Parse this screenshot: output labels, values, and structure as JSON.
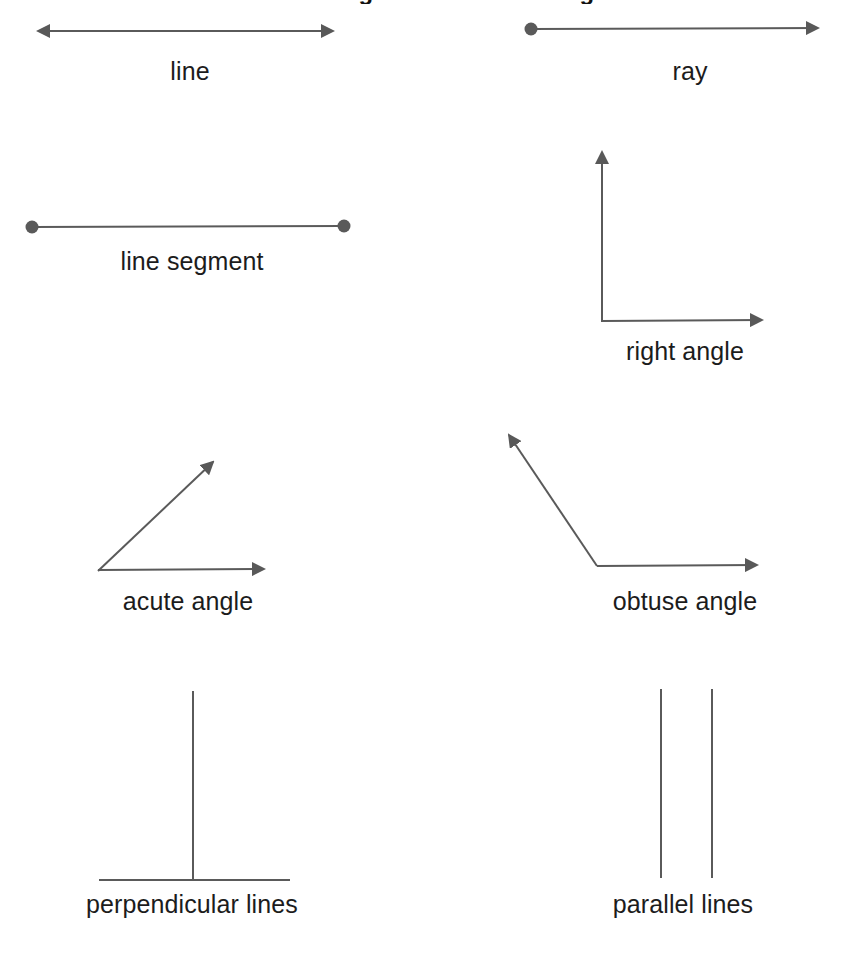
{
  "page": {
    "width": 847,
    "height": 958,
    "background": "#ffffff",
    "stroke_color": "#5a5a5a",
    "arrow_fill": "#595959",
    "label_color": "#1c1c1c",
    "cut_off_heading": "Lines and Angles Worksheet Diagram"
  },
  "figures": [
    {
      "id": "line",
      "label": "line",
      "type": "double-headed-arrow",
      "label_x": 190,
      "label_y": 57,
      "geometry": {
        "x1": 30,
        "y1": 31,
        "x2": 341,
        "y2": 31
      },
      "endpoints": {
        "start": "arrow",
        "end": "arrow"
      }
    },
    {
      "id": "ray",
      "label": "ray",
      "type": "single-headed-arrow-with-dot",
      "label_x": 690,
      "label_y": 57,
      "geometry": {
        "x1": 531,
        "y1": 29,
        "x2": 826,
        "y2": 28
      },
      "endpoints": {
        "start": "dot",
        "end": "arrow"
      }
    },
    {
      "id": "line-segment",
      "label": "line segment",
      "type": "segment-with-two-dots",
      "label_x": 192,
      "label_y": 247,
      "geometry": {
        "x1": 32,
        "y1": 227,
        "x2": 344,
        "y2": 226
      },
      "endpoints": {
        "start": "dot",
        "end": "dot"
      }
    },
    {
      "id": "right-angle",
      "label": "right angle",
      "type": "angle",
      "label_x": 685,
      "label_y": 337,
      "geometry": {
        "vertex_x": 602,
        "vertex_y": 322,
        "ray1_x": 602,
        "ray1_y": 142,
        "ray2_x": 772,
        "ray2_y": 320
      },
      "degrees": 90
    },
    {
      "id": "acute-angle",
      "label": "acute angle",
      "type": "angle",
      "label_x": 188,
      "label_y": 587,
      "geometry": {
        "vertex_x": 98,
        "vertex_y": 571,
        "ray1_x": 221,
        "ray1_y": 452,
        "ray2_x": 274,
        "ray2_y": 569
      },
      "degrees": 44
    },
    {
      "id": "obtuse-angle",
      "label": "obtuse angle",
      "type": "angle",
      "label_x": 685,
      "label_y": 587,
      "geometry": {
        "vertex_x": 597,
        "vertex_y": 566,
        "ray1_x": 500,
        "ray1_y": 424,
        "ray2_x": 767,
        "ray2_y": 565
      },
      "degrees": 124
    },
    {
      "id": "perpendicular-lines",
      "label": "perpendicular lines",
      "type": "perpendicular",
      "label_x": 192,
      "label_y": 890,
      "geometry": {
        "vertical_x": 193,
        "vertical_y1": 691,
        "vertical_y2": 880,
        "horizontal_x1": 99,
        "horizontal_x2": 290,
        "horizontal_y": 880
      }
    },
    {
      "id": "parallel-lines",
      "label": "parallel lines",
      "type": "parallel",
      "label_x": 683,
      "label_y": 890,
      "geometry": {
        "line_a_x": 661,
        "line_b_x": 712,
        "y1": 689,
        "y2": 878
      }
    }
  ]
}
